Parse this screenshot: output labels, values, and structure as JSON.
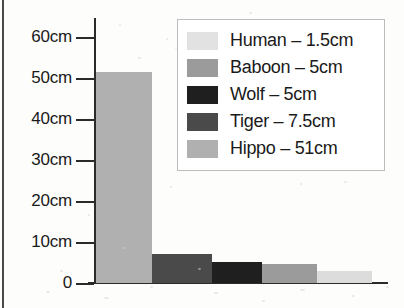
{
  "chart_data": {
    "type": "bar",
    "title": "",
    "xlabel": "",
    "ylabel": "",
    "ylim": [
      0,
      60
    ],
    "grid": false,
    "legend_position": "top-right",
    "categories": [
      "Hippo",
      "Tiger",
      "Wolf",
      "Baboon",
      "Human"
    ],
    "values": [
      51,
      7.5,
      5,
      5,
      1.5
    ],
    "units": "cm",
    "y_ticks": [
      {
        "label": "60cm",
        "value": 60
      },
      {
        "label": "50cm",
        "value": 50
      },
      {
        "label": "40cm",
        "value": 40
      },
      {
        "label": "30cm",
        "value": 30
      },
      {
        "label": "20cm",
        "value": 20
      },
      {
        "label": "10cm",
        "value": 10
      },
      {
        "label": "0",
        "value": 0
      }
    ],
    "bars": [
      {
        "name": "Hippo",
        "label": "Hippo – 51cm",
        "value": 51,
        "color": "#b0b0b0",
        "x": 96,
        "width": 56,
        "pixel_height": 211
      },
      {
        "name": "Tiger",
        "label": "Tiger – 7.5cm",
        "value": 7.5,
        "color": "#4a4a4a",
        "x": 152,
        "width": 60,
        "pixel_height": 29
      },
      {
        "name": "Wolf",
        "label": "Wolf – 5cm",
        "value": 5,
        "color": "#1f1f1f",
        "x": 212,
        "width": 50,
        "pixel_height": 21
      },
      {
        "name": "Baboon",
        "label": "Baboon – 5cm",
        "value": 5,
        "color": "#9b9b9b",
        "x": 262,
        "width": 55,
        "pixel_height": 19
      },
      {
        "name": "Human",
        "label": "Human – 1.5cm",
        "value": 1.5,
        "color": "#dcdcdc",
        "x": 317,
        "width": 55,
        "pixel_height": 12
      }
    ],
    "legend": [
      {
        "name": "Human",
        "text": "Human – 1.5cm",
        "color": "#e2e2e2"
      },
      {
        "name": "Baboon",
        "text": "Baboon – 5cm",
        "color": "#9b9b9b"
      },
      {
        "name": "Wolf",
        "text": "Wolf – 5cm",
        "color": "#1f1f1f"
      },
      {
        "name": "Tiger",
        "text": "Tiger – 7.5cm",
        "color": "#4a4a4a"
      },
      {
        "name": "Hippo",
        "text": "Hippo – 51cm",
        "color": "#b0b0b0"
      }
    ]
  }
}
